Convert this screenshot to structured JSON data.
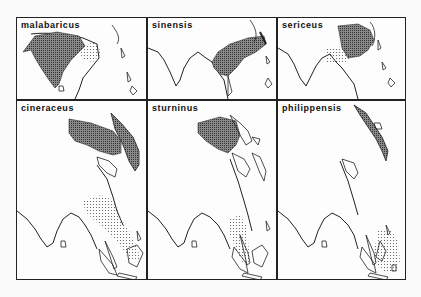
{
  "figure": {
    "panels": [
      {
        "id": "malabaricus",
        "label": "malabaricus",
        "row": 0,
        "col": 0,
        "range_types": [
          "breeding-hatched",
          "wintering-dotted"
        ]
      },
      {
        "id": "sinensis",
        "label": "sinensis",
        "row": 0,
        "col": 1,
        "range_types": [
          "breeding-hatched"
        ]
      },
      {
        "id": "sericeus",
        "label": "sericeus",
        "row": 0,
        "col": 2,
        "range_types": [
          "breeding-hatched",
          "wintering-dotted"
        ]
      },
      {
        "id": "cineraceus",
        "label": "cineraceus",
        "row": 1,
        "col": 0,
        "range_types": [
          "breeding-hatched",
          "wintering-dotted"
        ]
      },
      {
        "id": "sturninus",
        "label": "sturninus",
        "row": 1,
        "col": 1,
        "range_types": [
          "breeding-hatched",
          "wintering-dotted"
        ]
      },
      {
        "id": "philippensis",
        "label": "philippensis",
        "row": 1,
        "col": 2,
        "range_types": [
          "breeding-hatched",
          "wintering-dotted"
        ]
      }
    ],
    "colors": {
      "border": "#222222",
      "coast": "#222222",
      "breeding_fill": "#6a6a6a",
      "wintering_dots": "#555555",
      "background": "#fdfdfd"
    }
  }
}
